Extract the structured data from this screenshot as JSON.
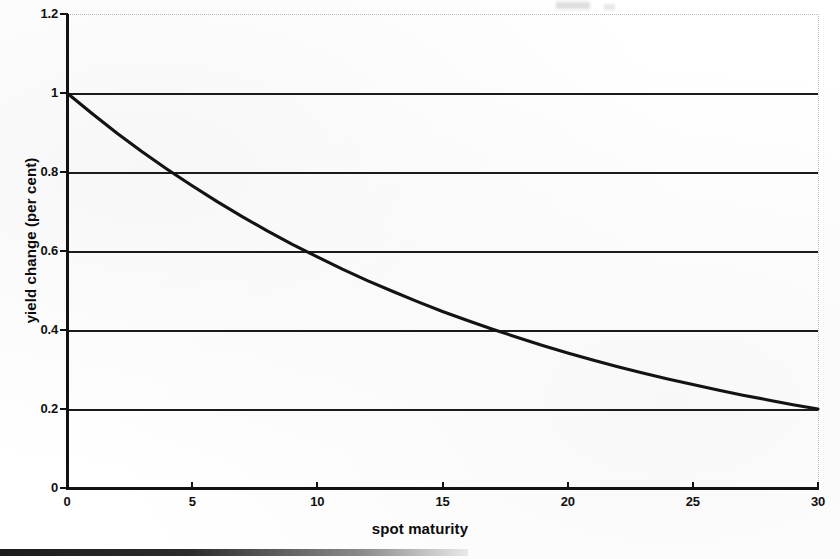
{
  "figure": {
    "background_color": "#ffffff",
    "ink_color": "#121212"
  },
  "chart_data": {
    "type": "line",
    "title": "",
    "subtitle": "",
    "xlabel": "spot maturity",
    "ylabel": "yield change (per cent)",
    "xlim": [
      0,
      30
    ],
    "ylim": [
      0,
      1.2
    ],
    "grid": true,
    "legend": null,
    "x_ticks": [
      0,
      5,
      10,
      15,
      20,
      25,
      30
    ],
    "x_tick_labels": [
      "0",
      "5",
      "10",
      "15",
      "20",
      "25",
      "30"
    ],
    "y_ticks": [
      0,
      0.2,
      0.4,
      0.6,
      0.8,
      1,
      1.2
    ],
    "y_tick_labels": [
      "0",
      "0.2",
      "0.4",
      "0.6",
      "0.8",
      "1",
      "1.2"
    ],
    "gridlines_y": [
      0.2,
      0.4,
      0.6,
      0.8,
      1
    ],
    "series": [
      {
        "name": "yield change",
        "description": "exponential decay of yield change with spot maturity",
        "x": [
          0,
          1,
          2,
          3,
          4,
          5,
          6,
          7,
          8,
          9,
          10,
          11,
          12,
          13,
          14,
          15,
          16,
          17,
          18,
          19,
          20,
          21,
          22,
          23,
          24,
          25,
          26,
          27,
          28,
          29,
          30
        ],
        "y": [
          1.0,
          0.948,
          0.898,
          0.851,
          0.807,
          0.765,
          0.725,
          0.687,
          0.651,
          0.617,
          0.585,
          0.554,
          0.525,
          0.498,
          0.472,
          0.447,
          0.424,
          0.402,
          0.381,
          0.361,
          0.342,
          0.324,
          0.307,
          0.291,
          0.276,
          0.262,
          0.248,
          0.235,
          0.223,
          0.211,
          0.2
        ]
      }
    ],
    "annotations": [
      {
        "text": "curve crosses 0.8 at maturity ≈ 4.2"
      },
      {
        "text": "curve crosses 0.6 at maturity ≈ 9.5"
      },
      {
        "text": "curve crosses 0.4 at maturity ≈ 17.1"
      }
    ]
  }
}
